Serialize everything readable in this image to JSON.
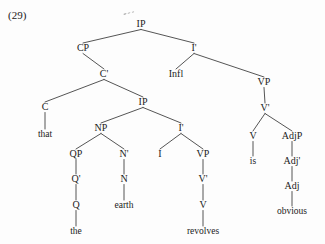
{
  "figure": {
    "example_number": "(29)",
    "type": "x-bar-syntax-tree",
    "sentence": "that the earth revolves is obvious"
  },
  "nodes": {
    "ip_root": {
      "label": "IP",
      "x": 141,
      "y": 27
    },
    "cp": {
      "label": "CP",
      "x": 83,
      "y": 51
    },
    "i_bar_top": {
      "label": "I'",
      "x": 194,
      "y": 51
    },
    "infl": {
      "label": "Infl",
      "x": 176,
      "y": 77
    },
    "vp_main": {
      "label": "VP",
      "x": 264,
      "y": 85
    },
    "c_bar": {
      "label": "C'",
      "x": 104,
      "y": 77
    },
    "c": {
      "label": "C",
      "x": 45,
      "y": 110
    },
    "that": {
      "label": "that",
      "x": 45,
      "y": 137
    },
    "ip_embedded": {
      "label": "IP",
      "x": 143,
      "y": 105
    },
    "np": {
      "label": "NP",
      "x": 101,
      "y": 131
    },
    "i_bar_emb": {
      "label": "I'",
      "x": 181,
      "y": 131
    },
    "qp": {
      "label": "QP",
      "x": 76,
      "y": 157
    },
    "n_bar": {
      "label": "N'",
      "x": 124,
      "y": 157
    },
    "q_bar": {
      "label": "Q'",
      "x": 76,
      "y": 182
    },
    "n": {
      "label": "N",
      "x": 124,
      "y": 182
    },
    "q": {
      "label": "Q",
      "x": 76,
      "y": 208
    },
    "earth": {
      "label": "earth",
      "x": 124,
      "y": 208
    },
    "the": {
      "label": "the",
      "x": 76,
      "y": 234
    },
    "i_emb": {
      "label": "I",
      "x": 160,
      "y": 157
    },
    "vp_emb": {
      "label": "VP",
      "x": 203,
      "y": 157
    },
    "v_bar_emb": {
      "label": "V'",
      "x": 203,
      "y": 182
    },
    "v_emb": {
      "label": "V",
      "x": 203,
      "y": 208
    },
    "revolves": {
      "label": "revolves",
      "x": 203,
      "y": 234
    },
    "v_bar_main": {
      "label": "V'",
      "x": 265,
      "y": 111
    },
    "v_main": {
      "label": "V",
      "x": 253,
      "y": 139
    },
    "is": {
      "label": "is",
      "x": 253,
      "y": 164
    },
    "adjp": {
      "label": "AdjP",
      "x": 292,
      "y": 139
    },
    "adj_bar": {
      "label": "Adj'",
      "x": 292,
      "y": 164
    },
    "adj": {
      "label": "Adj",
      "x": 292,
      "y": 189
    },
    "obvious": {
      "label": "obvious",
      "x": 292,
      "y": 214
    }
  },
  "edges": [
    {
      "from": "ip_root",
      "to": "cp"
    },
    {
      "from": "ip_root",
      "to": "i_bar_top"
    },
    {
      "from": "i_bar_top",
      "to": "infl"
    },
    {
      "from": "i_bar_top",
      "to": "vp_main"
    },
    {
      "from": "cp",
      "to": "c_bar"
    },
    {
      "from": "c_bar",
      "to": "c"
    },
    {
      "from": "c_bar",
      "to": "ip_embedded"
    },
    {
      "from": "c",
      "to": "that"
    },
    {
      "from": "ip_embedded",
      "to": "np"
    },
    {
      "from": "ip_embedded",
      "to": "i_bar_emb"
    },
    {
      "from": "np",
      "to": "qp"
    },
    {
      "from": "np",
      "to": "n_bar"
    },
    {
      "from": "qp",
      "to": "q_bar"
    },
    {
      "from": "q_bar",
      "to": "q"
    },
    {
      "from": "q",
      "to": "the"
    },
    {
      "from": "n_bar",
      "to": "n"
    },
    {
      "from": "n",
      "to": "earth"
    },
    {
      "from": "i_bar_emb",
      "to": "i_emb"
    },
    {
      "from": "i_bar_emb",
      "to": "vp_emb"
    },
    {
      "from": "vp_emb",
      "to": "v_bar_emb"
    },
    {
      "from": "v_bar_emb",
      "to": "v_emb"
    },
    {
      "from": "v_emb",
      "to": "revolves"
    },
    {
      "from": "vp_main",
      "to": "v_bar_main"
    },
    {
      "from": "v_bar_main",
      "to": "v_main"
    },
    {
      "from": "v_bar_main",
      "to": "adjp"
    },
    {
      "from": "v_main",
      "to": "is"
    },
    {
      "from": "adjp",
      "to": "adj_bar"
    },
    {
      "from": "adj_bar",
      "to": "adj"
    },
    {
      "from": "adj",
      "to": "obvious"
    }
  ],
  "colors": {
    "ink": "#1b1b1b",
    "branch": "#2a2a2a",
    "background": "#fdfdfd"
  }
}
